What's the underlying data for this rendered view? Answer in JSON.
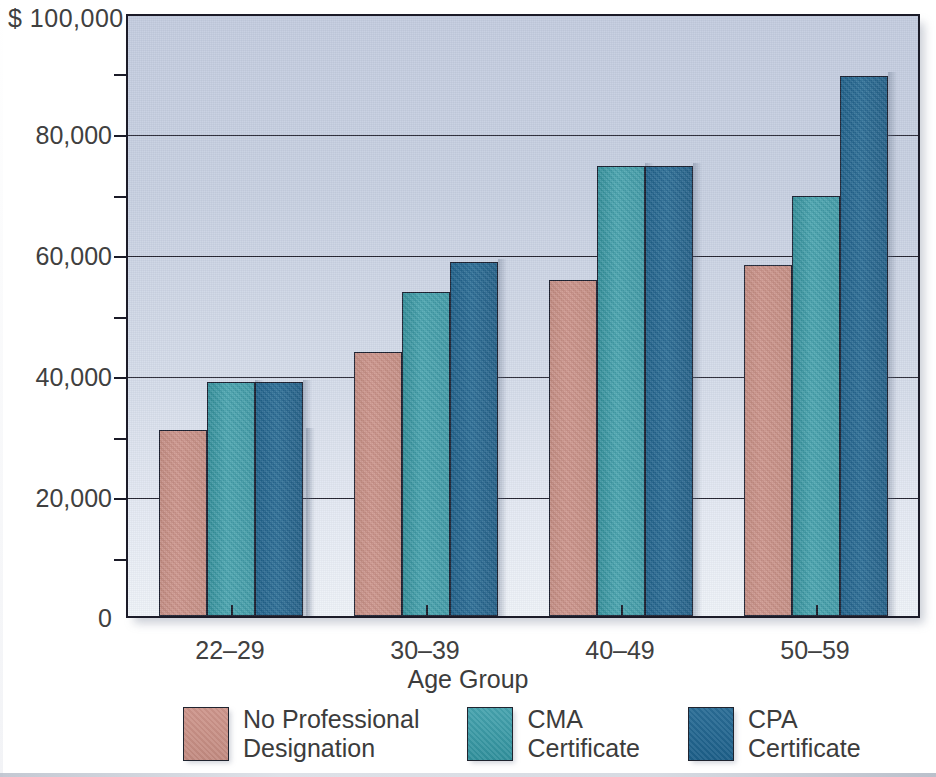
{
  "chart_data": {
    "type": "bar",
    "title": "",
    "xlabel": "Age Group",
    "ylabel": "$ 100,000",
    "categories": [
      "22–29",
      "30–39",
      "40–49",
      "50–59"
    ],
    "series": [
      {
        "name": "No Professional Designation",
        "color": "#c58d83",
        "values": [
          31000,
          44000,
          56000,
          58500
        ]
      },
      {
        "name": "CMA Certificate",
        "color": "#3f9aa6",
        "values": [
          39000,
          54000,
          75000,
          70000
        ]
      },
      {
        "name": "CPA Certificate",
        "color": "#225f87",
        "values": [
          39000,
          59000,
          75000,
          90000
        ]
      }
    ],
    "ylim": [
      0,
      100000
    ],
    "y_major_ticks": [
      0,
      20000,
      40000,
      60000,
      80000,
      100000
    ],
    "y_minor_ticks": [
      10000,
      30000,
      50000,
      70000,
      90000
    ],
    "y_tick_labels": [
      "0",
      "20,000",
      "40,000",
      "60,000",
      "80,000",
      "$ 100,000"
    ],
    "grid": true,
    "grid_axis": "y",
    "legend_position": "bottom",
    "plot_background": "#c9d1e2"
  },
  "axis": {
    "y_top_label": "$ 100,000",
    "y_labels": [
      "80,000",
      "60,000",
      "40,000",
      "20,000",
      "0"
    ],
    "x_title": "Age Group",
    "x_labels": [
      "22–29",
      "30–39",
      "40–49",
      "50–59"
    ]
  },
  "legend": {
    "items": [
      {
        "label_line1": "No Professional",
        "label_line2": "Designation",
        "swatch": "rose"
      },
      {
        "label_line1": "CMA",
        "label_line2": "Certificate",
        "swatch": "teal"
      },
      {
        "label_line1": "CPA",
        "label_line2": "Certificate",
        "swatch": "blue"
      }
    ]
  }
}
